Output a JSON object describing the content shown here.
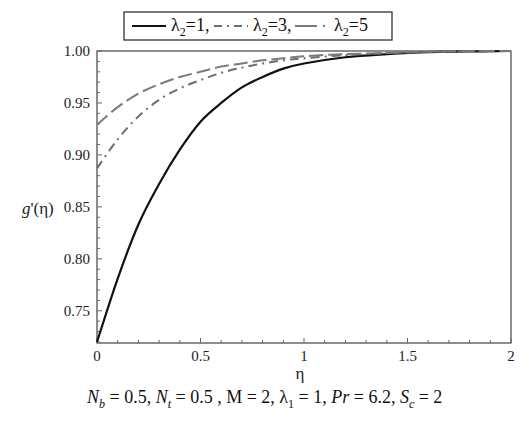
{
  "chart_data": {
    "type": "line",
    "title": "",
    "xlabel": "η",
    "ylabel": "g'(η)",
    "xlim": [
      0,
      2
    ],
    "ylim": [
      0.719,
      1.0
    ],
    "x_ticks": [
      "0",
      "0.5",
      "1",
      "1.5",
      "2"
    ],
    "y_ticks": [
      "0.75",
      "0.80",
      "0.85",
      "0.90",
      "0.95",
      "1.00"
    ],
    "grid": false,
    "legend_position": "top",
    "x": [
      0,
      0.1,
      0.2,
      0.3,
      0.4,
      0.5,
      0.6,
      0.7,
      0.8,
      0.9,
      1.0,
      1.2,
      1.4,
      1.6,
      1.8,
      2.0
    ],
    "series": [
      {
        "name": "λ2=1",
        "style": "solid",
        "color": "#111111",
        "values": [
          0.72,
          0.781,
          0.833,
          0.872,
          0.905,
          0.932,
          0.95,
          0.965,
          0.975,
          0.983,
          0.988,
          0.994,
          0.997,
          0.999,
          0.9995,
          1.0
        ]
      },
      {
        "name": "λ2=3",
        "style": "dash-dot",
        "color": "#6e6e6e",
        "values": [
          0.887,
          0.915,
          0.937,
          0.953,
          0.964,
          0.972,
          0.979,
          0.984,
          0.988,
          0.991,
          0.993,
          0.996,
          0.998,
          0.999,
          0.9997,
          1.0
        ]
      },
      {
        "name": "λ2=5",
        "style": "long-dash",
        "color": "#7a7a7a",
        "values": [
          0.929,
          0.946,
          0.959,
          0.968,
          0.975,
          0.98,
          0.985,
          0.988,
          0.991,
          0.993,
          0.995,
          0.997,
          0.998,
          0.9993,
          0.9998,
          1.0
        ]
      }
    ],
    "annotation": "N_b = 0.5, N_t = 0.5 , M = 2, λ_1 = 1, Pr = 6.2, S_c = 2"
  },
  "legend": {
    "items": [
      {
        "symbol": "λ",
        "sub": "2",
        "suffix": "=1,"
      },
      {
        "symbol": "λ",
        "sub": "2",
        "suffix": "=3,"
      },
      {
        "symbol": "λ",
        "sub": "2",
        "suffix": "=5"
      }
    ]
  },
  "axes": {
    "ylabel_main": "g'(η)",
    "xlabel": "η"
  },
  "caption": {
    "parts": [
      {
        "text": "N",
        "italic": true
      },
      {
        "sub": "b",
        "italic": true
      },
      {
        "text": " = 0.5, "
      },
      {
        "text": "N",
        "italic": true
      },
      {
        "sub": "t",
        "italic": true
      },
      {
        "text": " = 0.5 , M = 2, λ"
      },
      {
        "sub": "1"
      },
      {
        "text": " = 1, "
      },
      {
        "text": "Pr",
        "italic": true
      },
      {
        "text": " = 6.2, "
      },
      {
        "text": "S",
        "italic": true
      },
      {
        "sub": "c",
        "italic": true
      },
      {
        "text": " = 2"
      }
    ]
  }
}
